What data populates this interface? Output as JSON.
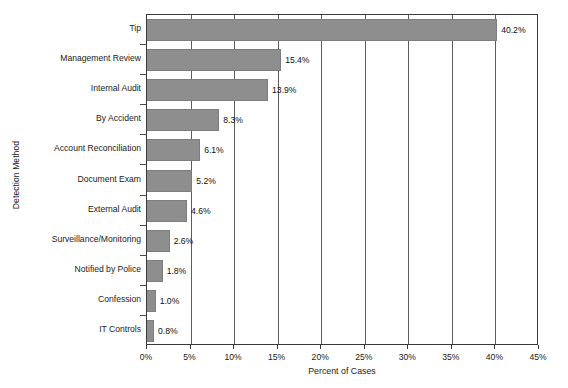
{
  "chart_data": {
    "type": "bar",
    "orientation": "horizontal",
    "title": "",
    "xlabel": "Percent of Cases",
    "ylabel": "Detection Method",
    "categories": [
      "Tip",
      "Management Review",
      "Internal Audit",
      "By Accident",
      "Account Reconciliation",
      "Document Exam",
      "External Audit",
      "Surveillance/Monitoring",
      "Notified by Police",
      "Confession",
      "IT Controls"
    ],
    "values": [
      40.2,
      15.4,
      13.9,
      8.3,
      6.1,
      5.2,
      4.6,
      2.6,
      1.8,
      1.0,
      0.8
    ],
    "data_labels": [
      "40.2%",
      "15.4%",
      "13.9%",
      "8.3%",
      "6.1%",
      "5.2%",
      "4.6%",
      "2.6%",
      "1.8%",
      "1.0%",
      "0.8%"
    ],
    "xlim": [
      0,
      45
    ],
    "xticks": [
      0,
      5,
      10,
      15,
      20,
      25,
      30,
      35,
      40,
      45
    ],
    "xtick_labels": [
      "0%",
      "5%",
      "10%",
      "15%",
      "20%",
      "25%",
      "30%",
      "35%",
      "40%",
      "45%"
    ],
    "grid": "vertical",
    "legend": null,
    "bar_color": "#8e8e8e",
    "axis_color": "#3a3a3a",
    "background_color": "#ffffff"
  }
}
